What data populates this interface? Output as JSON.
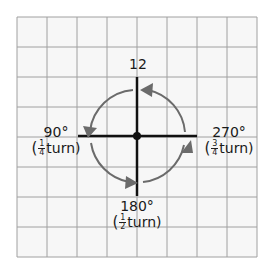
{
  "diagram": {
    "grid": {
      "columns": 8,
      "rows": 8,
      "line_color": "#a0a0a0",
      "background": "#f7f7f7"
    },
    "axis_color": "#111111",
    "arc_color": "#6b6b6b",
    "labels": {
      "top": {
        "text": "12"
      },
      "left": {
        "degrees": "90°",
        "paren_open": "(",
        "num": "1",
        "den": "4",
        "word": "turn)"
      },
      "right": {
        "degrees": "270°",
        "paren_open": "(",
        "num": "3",
        "den": "4",
        "word": "turn)"
      },
      "bottom": {
        "degrees": "180°",
        "paren_open": "(",
        "num": "1",
        "den": "2",
        "word": "turn)"
      }
    }
  }
}
